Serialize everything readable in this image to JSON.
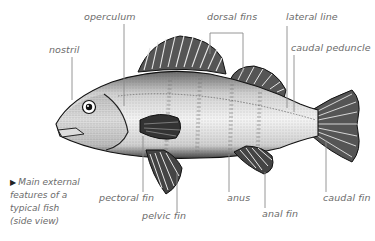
{
  "diagram": {
    "title": "Main external features of a typical fish (side view)",
    "caption_lines": [
      "Main external",
      "features of a",
      "typical fish",
      "(side view)"
    ],
    "caption_marker": "▶",
    "colors": {
      "label_text": "#6b6b6b",
      "leader_line": "#8a8a8a",
      "ink": "#1a1a1a",
      "background": "#ffffff"
    },
    "labels": {
      "nostril": "nostril",
      "operculum": "operculum",
      "dorsal_fins": "dorsal fins",
      "lateral_line": "lateral line",
      "caudal_peduncle": "caudal peduncle",
      "pectoral_fin": "pectoral fin",
      "pelvic_fin": "pelvic fin",
      "anus": "anus",
      "anal_fin": "anal fin",
      "caudal_fin": "caudal fin"
    }
  }
}
